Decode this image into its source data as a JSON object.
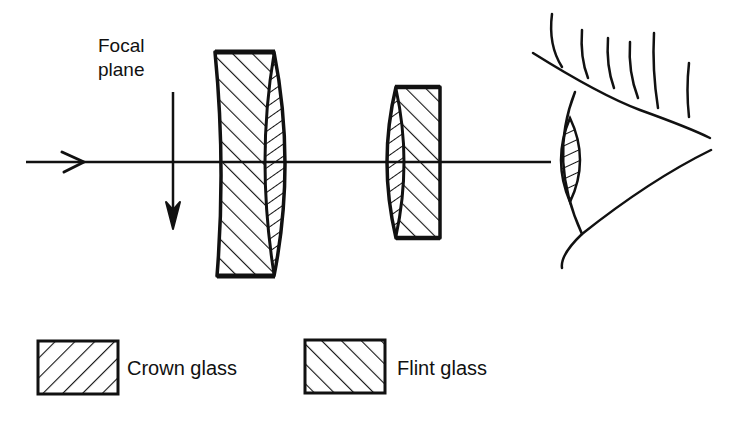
{
  "labels": {
    "focal_plane_line1": "Focal",
    "focal_plane_line2": "plane"
  },
  "legend": {
    "items": [
      {
        "name": "crown",
        "label": "Crown glass",
        "hatch": "forward-diagonal"
      },
      {
        "name": "flint",
        "label": "Flint glass",
        "hatch": "back-diagonal"
      }
    ]
  },
  "colors": {
    "ink": "#111111",
    "background": "#ffffff"
  }
}
